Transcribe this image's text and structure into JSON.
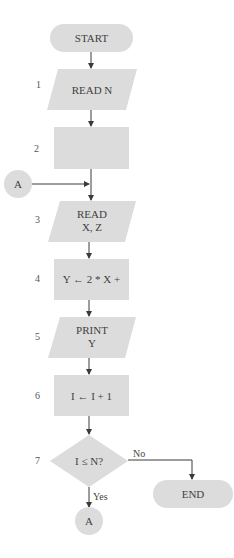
{
  "colors": {
    "shape_fill": "#dcdcdc",
    "line": "#3a3a3a",
    "text": "#3f3f3f",
    "background": "#ffffff"
  },
  "flowchart": {
    "start": {
      "label": "START",
      "shape": "terminal"
    },
    "steps": [
      {
        "num": "1",
        "shape": "parallelogram",
        "line1": "READ N",
        "line2": ""
      },
      {
        "num": "2",
        "shape": "process",
        "line1": "",
        "line2": ""
      },
      {
        "num": "3",
        "shape": "parallelogram",
        "line1": "READ",
        "line2": "X, Z"
      },
      {
        "num": "4",
        "shape": "process",
        "line1": "Y ← 2 * X +",
        "line2": ""
      },
      {
        "num": "5",
        "shape": "parallelogram",
        "line1": "PRINT",
        "line2": "Y"
      },
      {
        "num": "6",
        "shape": "process",
        "line1": "I ← I + 1",
        "line2": ""
      },
      {
        "num": "7",
        "shape": "decision",
        "line1": "I ≤ N?",
        "line2": ""
      }
    ],
    "connector_in": {
      "label": "A"
    },
    "connector_out": {
      "label": "A"
    },
    "end": {
      "label": "END",
      "shape": "terminal"
    },
    "edges": {
      "yes_label": "Yes",
      "no_label": "No"
    }
  }
}
